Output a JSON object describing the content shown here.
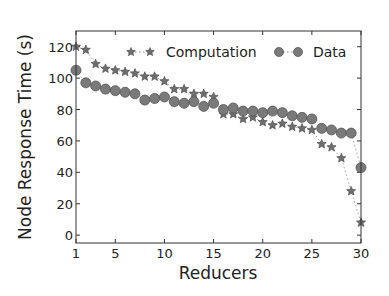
{
  "chart_data": {
    "type": "line",
    "title": "",
    "xlabel": "Reducers",
    "ylabel": "Node Response Time (s)",
    "xlim": [
      1,
      30
    ],
    "ylim": [
      -5,
      130
    ],
    "xticks": [
      1,
      5,
      10,
      15,
      20,
      25,
      30
    ],
    "yticks": [
      0,
      20,
      40,
      60,
      80,
      100,
      120
    ],
    "grid": false,
    "legend_position": "upper right (inside)",
    "x": [
      1,
      2,
      3,
      4,
      5,
      6,
      7,
      8,
      9,
      10,
      11,
      12,
      13,
      14,
      15,
      16,
      17,
      18,
      19,
      20,
      21,
      22,
      23,
      24,
      25,
      26,
      27,
      28,
      29,
      30
    ],
    "series": [
      {
        "name": "Computation",
        "marker": "star",
        "line_style": "dotted",
        "color": "#6e6e6e",
        "values": [
          120,
          118,
          109,
          106,
          105,
          104,
          103,
          101,
          101,
          98,
          93,
          93,
          90,
          90,
          88,
          77,
          77,
          74,
          75,
          72,
          70,
          71,
          69,
          68,
          67,
          58,
          56,
          49,
          28,
          8
        ]
      },
      {
        "name": "Data",
        "marker": "circle",
        "line_style": "dotted",
        "color": "#7a7a7a",
        "values": [
          105,
          97,
          95,
          93,
          92,
          91,
          90,
          86,
          87,
          88,
          85,
          84,
          85,
          82,
          84,
          80,
          81,
          79,
          79,
          78,
          79,
          78,
          76,
          75,
          74,
          68,
          67,
          65,
          65,
          43
        ]
      }
    ]
  },
  "legend": {
    "items": [
      {
        "label": "Computation"
      },
      {
        "label": "Data"
      }
    ]
  },
  "axes": {
    "xlabel": "Reducers",
    "ylabel": "Node Response Time (s)"
  }
}
